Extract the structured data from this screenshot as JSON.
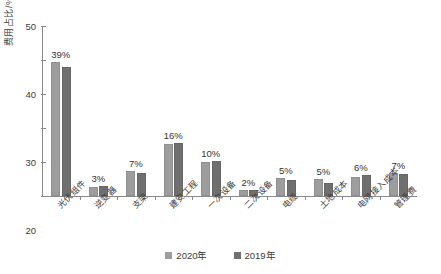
{
  "chart_data": {
    "type": "bar",
    "title": "",
    "xlabel": "",
    "ylabel": "费用占比/%",
    "ylim": [
      0,
      50
    ],
    "yticks": [
      0,
      10,
      20,
      30,
      40,
      50
    ],
    "grid": false,
    "legend_position": "bottom",
    "categories": [
      "光伏组件",
      "逆变器",
      "支架",
      "建安工程",
      "一次设备",
      "二次设备",
      "电缆",
      "土地成本",
      "电网接入成本",
      "管理费"
    ],
    "data_labels": [
      "39%",
      "3%",
      "7%",
      "16%",
      "10%",
      "2%",
      "5%",
      "5%",
      "6%",
      "7%"
    ],
    "series": [
      {
        "name": "2020年",
        "color": "#9d9d9d",
        "values": [
          39.4,
          2.7,
          7.3,
          15.2,
          10.1,
          1.9,
          5.2,
          5.1,
          5.6,
          6.8
        ]
      },
      {
        "name": "2019年",
        "color": "#6f6f6f",
        "values": [
          38.0,
          2.8,
          6.8,
          15.6,
          10.3,
          1.8,
          4.7,
          3.9,
          6.3,
          6.6
        ]
      }
    ]
  }
}
